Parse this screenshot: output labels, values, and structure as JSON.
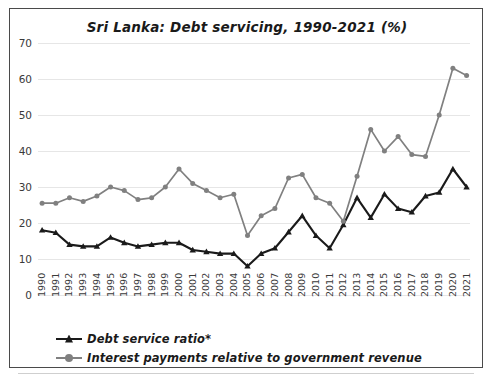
{
  "chart_data": {
    "type": "line",
    "title": "Sri Lanka: Debt servicing, 1990-2021 (%)",
    "xlabel": "",
    "ylabel": "",
    "ylim": [
      0,
      70
    ],
    "yticks": [
      0,
      10,
      20,
      30,
      40,
      50,
      60,
      70
    ],
    "grid": true,
    "legend_position": "bottom-left",
    "categories": [
      "1990",
      "1991",
      "1992",
      "1993",
      "1994",
      "1995",
      "1996",
      "1997",
      "1998",
      "1999",
      "2000",
      "2001",
      "2002",
      "2003",
      "2004",
      "2005",
      "2006",
      "2007",
      "2008",
      "2009",
      "2010",
      "2011",
      "2012",
      "2013",
      "2014",
      "2015",
      "2016",
      "2017",
      "2018",
      "2019",
      "2020",
      "2021"
    ],
    "series": [
      {
        "name": "Debt service ratio*",
        "color": "#1a1a1a",
        "marker": "triangle",
        "values": [
          18.0,
          17.3,
          14.0,
          13.5,
          13.5,
          16.0,
          14.5,
          13.5,
          14.0,
          14.5,
          14.5,
          12.5,
          12.0,
          11.5,
          11.5,
          8.0,
          11.5,
          13.0,
          17.5,
          22.0,
          16.5,
          13.0,
          19.5,
          27.0,
          21.5,
          28.0,
          24.0,
          23.0,
          27.5,
          28.5,
          35.0,
          30.0
        ]
      },
      {
        "name": "Interest payments relative to government revenue",
        "color": "#808080",
        "marker": "circle",
        "values": [
          25.5,
          25.5,
          27.0,
          26.0,
          27.5,
          30.0,
          29.0,
          26.5,
          27.0,
          30.0,
          35.0,
          31.0,
          29.0,
          27.0,
          28.0,
          16.5,
          22.0,
          24.0,
          32.5,
          33.5,
          27.0,
          25.5,
          20.5,
          33.0,
          46.0,
          40.0,
          44.0,
          39.0,
          38.5,
          50.0,
          55.0,
          63.0
        ]
      }
    ],
    "series_last_point_override": {
      "note_gray_2021": 61.0
    }
  },
  "legend": {
    "items": [
      {
        "label": "Debt service ratio*"
      },
      {
        "label": "Interest payments relative to government revenue"
      }
    ]
  }
}
